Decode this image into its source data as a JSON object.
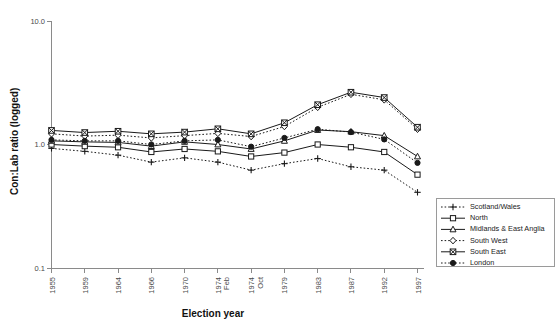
{
  "chart_data": {
    "type": "line",
    "title": "",
    "xlabel": "Election year",
    "ylabel": "Con:Lab ratio (logged)",
    "y_scale": "log",
    "ylim": [
      0.1,
      10.0
    ],
    "ytick_labels": [
      "10.0",
      "1.0",
      "0.1"
    ],
    "ytick_values": [
      10.0,
      1.0,
      0.1
    ],
    "grid": false,
    "legend_position": "right",
    "categories": [
      "1955",
      "1959",
      "1964",
      "1966",
      "1970",
      "1974\nFeb",
      "1974\nOct",
      "1979",
      "1983",
      "1987",
      "1992",
      "1997"
    ],
    "x_tick_labels": [
      [
        "1955"
      ],
      [
        "1959"
      ],
      [
        "1964"
      ],
      [
        "1966"
      ],
      [
        "1970"
      ],
      [
        "1974",
        "Feb"
      ],
      [
        "1974",
        "Oct"
      ],
      [
        "1979"
      ],
      [
        "1983"
      ],
      [
        "1987"
      ],
      [
        "1992"
      ],
      [
        "1997"
      ]
    ],
    "series": [
      {
        "name": "Scotland/Wales",
        "marker": "plus",
        "line_style": "dotted",
        "values": [
          0.93,
          0.88,
          0.82,
          0.72,
          0.78,
          0.72,
          0.62,
          0.7,
          0.77,
          0.66,
          0.62,
          0.41
        ]
      },
      {
        "name": "North",
        "marker": "open-square",
        "line_style": "solid",
        "values": [
          1.0,
          0.97,
          0.95,
          0.87,
          0.92,
          0.88,
          0.8,
          0.86,
          1.0,
          0.95,
          0.87,
          0.57
        ]
      },
      {
        "name": "Midlands & East Anglia",
        "marker": "open-triangle",
        "line_style": "solid",
        "values": [
          1.07,
          1.05,
          1.04,
          0.97,
          1.05,
          1.0,
          0.92,
          1.07,
          1.31,
          1.27,
          1.18,
          0.8
        ]
      },
      {
        "name": "South West",
        "marker": "open-diamond",
        "line_style": "dotted",
        "values": [
          1.22,
          1.17,
          1.19,
          1.13,
          1.18,
          1.23,
          1.16,
          1.4,
          2.0,
          2.55,
          2.3,
          1.33
        ]
      },
      {
        "name": "South East",
        "marker": "crossed-square",
        "line_style": "solid",
        "values": [
          1.3,
          1.25,
          1.28,
          1.22,
          1.26,
          1.34,
          1.22,
          1.5,
          2.1,
          2.65,
          2.4,
          1.38
        ]
      },
      {
        "name": "London",
        "marker": "filled-circle",
        "line_style": "dotted",
        "values": [
          1.09,
          1.07,
          1.07,
          1.0,
          1.07,
          1.09,
          0.96,
          1.13,
          1.33,
          1.26,
          1.1,
          0.71
        ]
      }
    ]
  },
  "legend": {
    "entries": [
      {
        "label": "Scotland/Wales"
      },
      {
        "label": "North"
      },
      {
        "label": "Midlands & East Anglia"
      },
      {
        "label": "South West"
      },
      {
        "label": "South East"
      },
      {
        "label": "London"
      }
    ]
  }
}
